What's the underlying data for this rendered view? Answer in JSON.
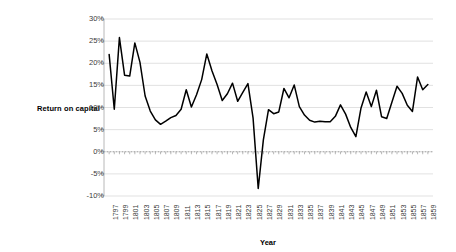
{
  "chart_data": {
    "type": "line",
    "title": "",
    "xlabel": "Year",
    "ylabel": "Return on capital",
    "ylim": [
      -10,
      30
    ],
    "xlim": [
      1796,
      1860
    ],
    "grid": true,
    "legend": false,
    "ytick_labels": [
      "30%",
      "25%",
      "20%",
      "15%",
      "10%",
      "5%",
      "0%",
      "-5%",
      "-10%"
    ],
    "ytick_values": [
      30,
      25,
      20,
      15,
      10,
      5,
      0,
      -5,
      -10
    ],
    "xtick_labels": [
      "1797",
      "1799",
      "1801",
      "1803",
      "1805",
      "1807",
      "1809",
      "1811",
      "1813",
      "1815",
      "1817",
      "1819",
      "1821",
      "1823",
      "1825",
      "1827",
      "1829",
      "1831",
      "1833",
      "1835",
      "1837",
      "1839",
      "1841",
      "1843",
      "1845",
      "1847",
      "1849",
      "1851",
      "1853",
      "1855",
      "1857",
      "1859"
    ],
    "series": [
      {
        "name": "Return on capital",
        "color": "#000000",
        "x": [
          1797,
          1798,
          1799,
          1800,
          1801,
          1802,
          1803,
          1804,
          1805,
          1806,
          1807,
          1808,
          1809,
          1810,
          1811,
          1812,
          1813,
          1814,
          1815,
          1816,
          1817,
          1818,
          1819,
          1820,
          1821,
          1822,
          1823,
          1824,
          1825,
          1826,
          1827,
          1828,
          1829,
          1830,
          1831,
          1832,
          1833,
          1834,
          1835,
          1836,
          1837,
          1838,
          1839,
          1840,
          1841,
          1842,
          1843,
          1844,
          1845,
          1846,
          1847,
          1848,
          1849,
          1850,
          1851,
          1852,
          1853,
          1854,
          1855,
          1856,
          1857,
          1858,
          1859
        ],
        "values": [
          22.0,
          9.6,
          25.8,
          17.3,
          17.1,
          24.6,
          20.2,
          12.6,
          9.2,
          7.2,
          6.2,
          6.9,
          7.7,
          8.2,
          9.6,
          14.0,
          10.1,
          12.9,
          16.3,
          22.1,
          18.3,
          15.2,
          11.6,
          13.1,
          15.5,
          11.4,
          13.4,
          15.4,
          7.6,
          -8.3,
          2.7,
          9.5,
          8.6,
          9.0,
          14.3,
          12.2,
          15.1,
          10.2,
          8.3,
          7.1,
          6.7,
          6.9,
          6.8,
          6.8,
          8.0,
          10.6,
          8.5,
          5.5,
          3.4,
          9.9,
          13.5,
          10.2,
          13.9,
          7.9,
          7.5,
          11.2,
          14.8,
          13.2,
          10.5,
          9.1,
          16.9,
          14.0,
          15.2
        ]
      }
    ]
  },
  "plot": {
    "left_px": 104,
    "right_px": 433,
    "top_px": 19,
    "bottom_px": 196,
    "gridline_color": "#d9d9d9",
    "axis_color": "#b0b0b0",
    "line_color": "#000000",
    "background": "#ffffff"
  }
}
